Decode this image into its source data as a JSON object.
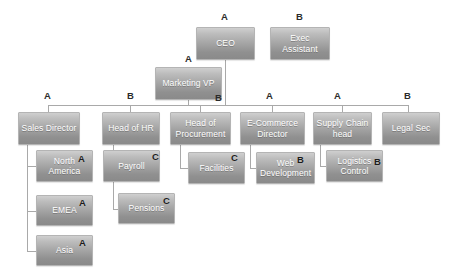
{
  "diagram": {
    "box_fill_top": "#cfcfcf",
    "box_fill_bottom": "#8a8a8a",
    "box_text_color": "#ffffff",
    "line_color": "#a9a9a9",
    "badge_color": "#2b2b2b",
    "background": "#ffffff"
  },
  "nodes": [
    {
      "id": "ceo",
      "label": "CEO",
      "badge": "A",
      "badge_pos": "above",
      "x": 196,
      "y": 27,
      "w": 59,
      "h": 33
    },
    {
      "id": "exec_assistant",
      "label": "Exec\nAssistant",
      "badge": "B",
      "badge_pos": "above",
      "x": 270,
      "y": 27,
      "w": 60,
      "h": 33
    },
    {
      "id": "marketing_vp",
      "label": "Marketing VP",
      "badge": "A",
      "badge_pos": "above",
      "x": 155,
      "y": 67,
      "w": 67,
      "h": 33
    },
    {
      "id": "sales_director",
      "label": "Sales Director",
      "badge": "A",
      "badge_pos": "above",
      "x": 18,
      "y": 112,
      "w": 62,
      "h": 33
    },
    {
      "id": "head_of_hr",
      "label": "Head of HR",
      "badge": "B",
      "badge_pos": "above",
      "x": 102,
      "y": 112,
      "w": 58,
      "h": 33
    },
    {
      "id": "head_of_procurement",
      "label": "Head of\nProcurement",
      "badge": "B",
      "badge_pos": "corner",
      "x": 170,
      "y": 112,
      "w": 61,
      "h": 33
    },
    {
      "id": "ecommerce_director",
      "label": "E-Commerce\nDirector",
      "badge": "A",
      "badge_pos": "above",
      "x": 240,
      "y": 112,
      "w": 65,
      "h": 33
    },
    {
      "id": "supply_chain_head",
      "label": "Supply Chain\nhead",
      "badge": "A",
      "badge_pos": "above",
      "x": 313,
      "y": 112,
      "w": 59,
      "h": 33
    },
    {
      "id": "legal_sec",
      "label": "Legal Sec",
      "badge": "B",
      "badge_pos": "above",
      "x": 382,
      "y": 112,
      "w": 58,
      "h": 33
    },
    {
      "id": "north_america",
      "label": "North\nAmerica",
      "badge": "A",
      "badge_pos": "inside",
      "x": 36,
      "y": 150,
      "w": 57,
      "h": 32
    },
    {
      "id": "payroll",
      "label": "Payroll",
      "badge": "C",
      "badge_pos": "inside",
      "x": 103,
      "y": 150,
      "w": 57,
      "h": 32
    },
    {
      "id": "facilities",
      "label": "Facilities",
      "badge": "C",
      "badge_pos": "inside",
      "x": 188,
      "y": 152,
      "w": 57,
      "h": 32
    },
    {
      "id": "web_development",
      "label": "Web\nDevelopment",
      "badge": "B",
      "badge_pos": "inside",
      "x": 256,
      "y": 152,
      "w": 59,
      "h": 32
    },
    {
      "id": "logistics_control",
      "label": "Logistics\nControl",
      "badge": "B",
      "badge_pos": "inside",
      "x": 326,
      "y": 150,
      "w": 57,
      "h": 32
    },
    {
      "id": "emea",
      "label": "EMEA",
      "badge": "A",
      "badge_pos": "inside",
      "x": 36,
      "y": 195,
      "w": 57,
      "h": 31
    },
    {
      "id": "pensions",
      "label": "Pensions",
      "badge": "C",
      "badge_pos": "inside",
      "x": 118,
      "y": 193,
      "w": 57,
      "h": 31
    },
    {
      "id": "asia",
      "label": "Asia",
      "badge": "A",
      "badge_pos": "inside",
      "x": 36,
      "y": 235,
      "w": 57,
      "h": 31
    }
  ],
  "badges": [
    {
      "for": "ceo",
      "letter": "A",
      "x": 221,
      "y": 12
    },
    {
      "for": "exec_assistant",
      "letter": "B",
      "x": 296,
      "y": 12
    },
    {
      "for": "marketing_vp",
      "letter": "A",
      "x": 185,
      "y": 54
    },
    {
      "for": "head_of_procurement",
      "letter": "B",
      "x": 215,
      "y": 93
    },
    {
      "for": "sales_director",
      "letter": "A",
      "x": 44,
      "y": 91
    },
    {
      "for": "head_of_hr",
      "letter": "B",
      "x": 127,
      "y": 91
    },
    {
      "for": "ecommerce_director",
      "letter": "A",
      "x": 266,
      "y": 91
    },
    {
      "for": "supply_chain_head",
      "letter": "A",
      "x": 334,
      "y": 91
    },
    {
      "for": "legal_sec",
      "letter": "B",
      "x": 404,
      "y": 91
    },
    {
      "for": "north_america",
      "letter": "A",
      "x": 78,
      "y": 154
    },
    {
      "for": "payroll",
      "letter": "C",
      "x": 152,
      "y": 152
    },
    {
      "for": "facilities",
      "letter": "C",
      "x": 231,
      "y": 153
    },
    {
      "for": "web_development",
      "letter": "B",
      "x": 297,
      "y": 155
    },
    {
      "for": "logistics_control",
      "letter": "B",
      "x": 374,
      "y": 157
    },
    {
      "for": "emea",
      "letter": "A",
      "x": 79,
      "y": 198
    },
    {
      "for": "pensions",
      "letter": "C",
      "x": 163,
      "y": 196
    },
    {
      "for": "asia",
      "letter": "A",
      "x": 79,
      "y": 238
    }
  ],
  "connectors": {
    "description": "Grey polyline connectors joining parent nodes to children",
    "paths": [
      "M 225.5 60 L 225.5 105",
      "M 48 105 L 408 105",
      "M 48 105 L 48 112",
      "M 130 105 L 130 112",
      "M 200 105 L 200 112",
      "M 272 105 L 272 112",
      "M 342 105 L 342 112",
      "M 408 105 L 408 112",
      "M 188 100 L 188 105",
      "M 27 145 L 27 251 L 36 251",
      "M 27 166 L 36 166",
      "M 27 211 L 36 211",
      "M 113 145 L 113 209 L 118 209",
      "M 113 168 L 103 168",
      "M 180 145 L 180 168 L 188 168",
      "M 250 145 L 250 168 L 256 168",
      "M 320 145 L 320 166 L 326 166"
    ]
  }
}
